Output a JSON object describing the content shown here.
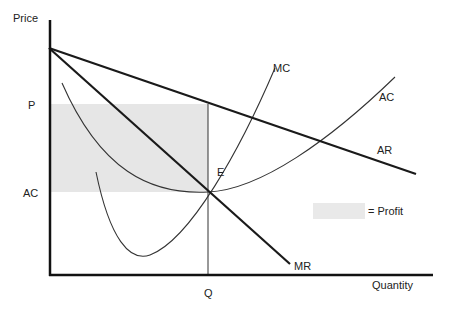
{
  "diagram": {
    "axes": {
      "y_label": "Price",
      "x_label": "Quantity"
    },
    "tick_labels": {
      "price_level": "P",
      "cost_level": "AC",
      "quantity_level": "Q"
    },
    "curves": {
      "ar": "AR",
      "mr": "MR",
      "mc": "MC",
      "ac": "AC"
    },
    "points": {
      "equilibrium": "E"
    },
    "legend": {
      "profit_label": "= Profit"
    },
    "colors": {
      "axis": "#111111",
      "demand_lines": "#1a1a1a",
      "cost_curves": "#333333",
      "profit_area": "#e6e6e6",
      "guide_line": "#333333"
    }
  }
}
